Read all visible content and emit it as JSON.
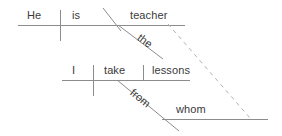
{
  "diagram": {
    "type": "reed-kellogg-sentence-diagram",
    "sentence": "He is the teacher from whom I take lessons",
    "canvas": {
      "width": 282,
      "height": 136
    },
    "style": {
      "line_color": "#8c8c8c",
      "dashed_line_color": "#b3b3b3",
      "text_color": "#3a3a3a",
      "background_color": "#ffffff",
      "line_width": 1
    },
    "labels": {
      "subject_main": "He",
      "verb_main": "is",
      "predicate_nominative": "teacher",
      "article_modifier": "the",
      "subject_clause": "I",
      "verb_clause": "take",
      "direct_object": "lessons",
      "preposition": "from",
      "object_of_preposition": "whom"
    },
    "baselines": [
      {
        "name": "main-clause-baseline",
        "x1": 18,
        "y1": 25,
        "x2": 185,
        "y2": 25
      },
      {
        "name": "relative-clause-baseline",
        "x1": 62,
        "y1": 80,
        "x2": 190,
        "y2": 80
      },
      {
        "name": "prepositional-object-baseline",
        "x1": 162,
        "y1": 119,
        "x2": 268,
        "y2": 119
      }
    ],
    "dividers": [
      {
        "name": "subject-verb-divider-main",
        "x": 60,
        "y1": 10,
        "y2": 41
      },
      {
        "name": "subject-verb-divider-clause",
        "x": 93,
        "y1": 65,
        "y2": 96
      },
      {
        "name": "verb-object-divider",
        "x": 143,
        "y1": 65,
        "y2": 80
      }
    ],
    "slants": [
      {
        "name": "predicate-nominative-slant",
        "x1": 103,
        "y1": 8,
        "x2": 121,
        "y2": 31
      },
      {
        "name": "article-modifier-slant",
        "x1": 118,
        "y1": 25,
        "x2": 163,
        "y2": 59
      },
      {
        "name": "preposition-slant",
        "x1": 117,
        "y1": 80,
        "x2": 179,
        "y2": 131
      }
    ],
    "dashed_connectors": [
      {
        "name": "relative-pronoun-reference-line",
        "x1": 168,
        "y1": 24,
        "x2": 250,
        "y2": 118
      }
    ]
  }
}
